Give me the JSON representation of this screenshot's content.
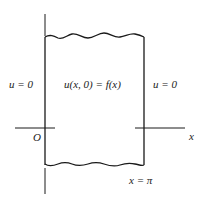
{
  "diagram": {
    "colors": {
      "stroke": "#1a1a1a",
      "text": "#222222",
      "background": "#ffffff"
    },
    "labels": {
      "left_boundary": "u = 0",
      "initial_condition": "u(x, 0) = f(x)",
      "right_boundary": "u = 0",
      "origin": "O",
      "x_axis": "x",
      "right_edge": "x = π"
    }
  }
}
